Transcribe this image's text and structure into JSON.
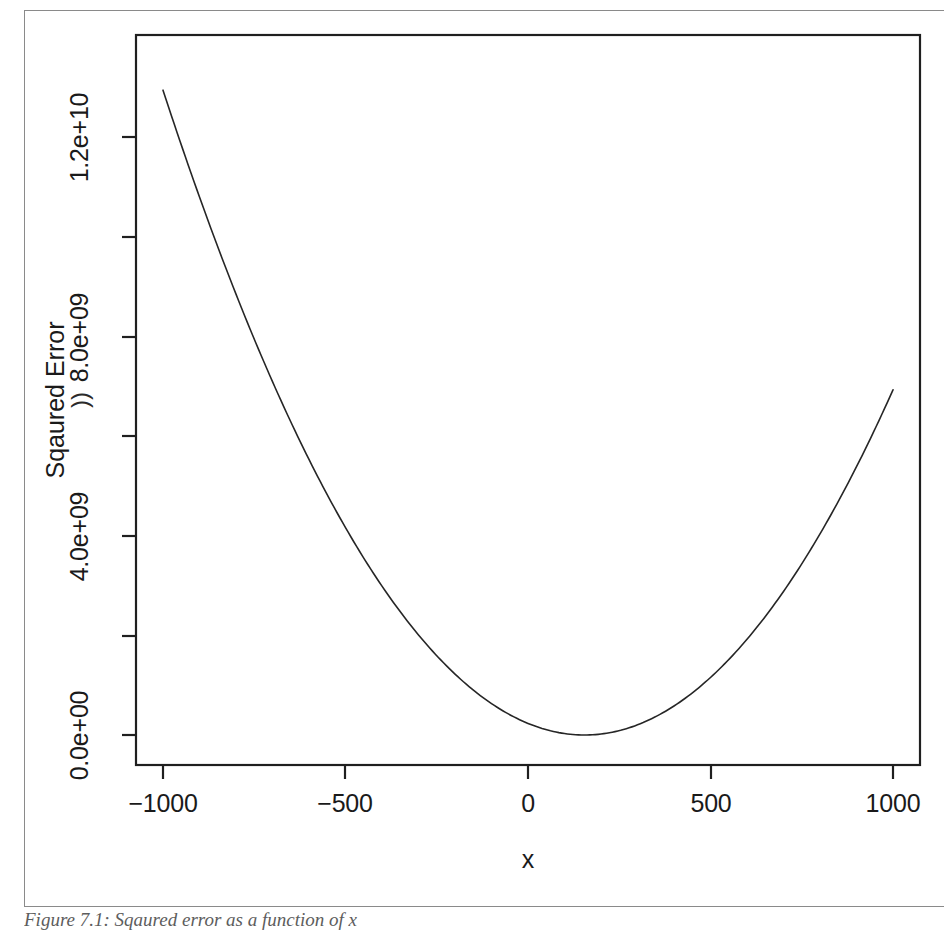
{
  "figure": {
    "caption": "Figure 7.1: Sqaured error as a function of x"
  },
  "chart_data": {
    "type": "line",
    "title": "",
    "subtitle": "",
    "xlabel": "x",
    "ylabel": "Sqaured Error",
    "grid": false,
    "legend": null,
    "xlim": [
      -1100,
      1100
    ],
    "ylim": [
      -700000000,
      14600000000
    ],
    "xticks": [
      -1000,
      -500,
      0,
      500,
      1000
    ],
    "xtick_labels": [
      "-1000",
      "-500",
      "0",
      "500",
      "1000"
    ],
    "yticks": [
      0,
      2000000000,
      4000000000,
      6000000000,
      8000000000,
      10000000000,
      12000000000,
      14000000000
    ],
    "ytick_labels": [
      "0.0e+00",
      "",
      "4.0e+09",
      "",
      "8.0e+09",
      "",
      "1.2e+10",
      ""
    ],
    "ytick_labeled": [
      true,
      false,
      true,
      false,
      true,
      false,
      true,
      false
    ],
    "curve": {
      "name": "squared error",
      "form": "quadratic",
      "vertex_x": 155,
      "vertex_y": 0,
      "coefficient_a": 9700,
      "color": "#262626",
      "line_width": 1.6,
      "x_start": -1000,
      "x_end": 1000,
      "x": [
        -1000,
        -900,
        -800,
        -700,
        -600,
        -500,
        -400,
        -300,
        -200,
        -100,
        0,
        100,
        200,
        300,
        400,
        500,
        600,
        700,
        800,
        900,
        1000
      ],
      "y": [
        12930000000,
        10906000000,
        9076000000,
        7440000000,
        5998000000,
        4750000000,
        3696000000,
        2836000000,
        2170000000,
        1698000000,
        1420000000,
        1336000000,
        1446000000,
        1750000000,
        2248000000,
        2940000000,
        3826000000,
        4906000000,
        6180000000,
        7648000000,
        9310000000
      ]
    },
    "endpoints": {
      "left": {
        "x": -1000,
        "y": 13700000000
      },
      "right": {
        "x": 1000,
        "y": 6800000000
      },
      "minimum": {
        "x": 155,
        "y": 0
      }
    },
    "axis_artifact_glyph": "))"
  },
  "ticks": {
    "x": [
      {
        "label": "-1000",
        "px": 163
      },
      {
        "label": "-500",
        "px": 345
      },
      {
        "label": "0",
        "px": 528
      },
      {
        "label": "500",
        "px": 711
      },
      {
        "label": "1000",
        "px": 893
      }
    ],
    "y": [
      {
        "label": "1.2e+10",
        "px": 137,
        "labeled": true
      },
      {
        "label": "",
        "px": 237,
        "labeled": false
      },
      {
        "label": "8.0e+09",
        "px": 337,
        "labeled": true
      },
      {
        "label": "",
        "px": 436,
        "labeled": false
      },
      {
        "label": "4.0e+09",
        "px": 536,
        "labeled": true
      },
      {
        "label": "",
        "px": 636,
        "labeled": false
      },
      {
        "label": "0.0e+00",
        "px": 735,
        "labeled": true
      }
    ]
  }
}
